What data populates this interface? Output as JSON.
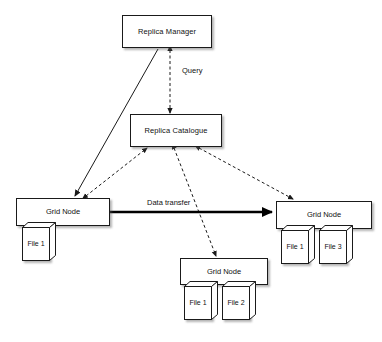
{
  "diagram": {
    "background_color": "#ffffff",
    "line_color": "#1a1a1a",
    "text_color": "#111111",
    "nodes": {
      "replica_manager": {
        "label": "Replica Manager"
      },
      "replica_catalogue": {
        "label": "Replica Catalogue"
      },
      "grid_node_left": {
        "label": "Grid Node",
        "files": [
          {
            "label": "File 1"
          }
        ]
      },
      "grid_node_right": {
        "label": "Grid Node",
        "files": [
          {
            "label": "File 1"
          },
          {
            "label": "File 3"
          }
        ]
      },
      "grid_node_bottom": {
        "label": "Grid Node",
        "files": [
          {
            "label": "File 1"
          },
          {
            "label": "File 2"
          }
        ]
      }
    },
    "edges": {
      "query": {
        "label": "Query",
        "style": "dashed",
        "arrows": "both"
      },
      "data_transfer": {
        "label": "Data transfer",
        "style": "solid-thick",
        "arrows": "end"
      },
      "manager_to_left_node": {
        "label": "",
        "style": "solid",
        "arrows": "end"
      },
      "left_node_to_catalogue": {
        "label": "",
        "style": "dashed",
        "arrows": "end"
      },
      "bottom_node_to_catalogue": {
        "label": "",
        "style": "dashed",
        "arrows": "both"
      },
      "right_node_to_catalogue": {
        "label": "",
        "style": "dashed",
        "arrows": "both"
      }
    }
  }
}
